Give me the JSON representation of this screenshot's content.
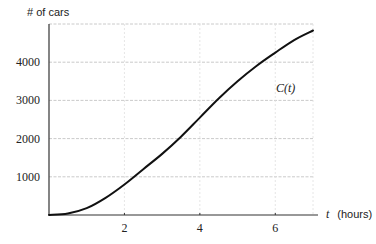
{
  "chart_data": {
    "type": "line",
    "title": "",
    "xlabel": "t (hours)",
    "xlabel_var": "t",
    "xlabel_unit": "(hours)",
    "ylabel": "# of cars",
    "curve_label": "C(t)",
    "xlim": [
      0,
      7
    ],
    "ylim": [
      0,
      5000
    ],
    "x_ticks": [
      2,
      4,
      6
    ],
    "x_tick_labels": [
      "2",
      "4",
      "6"
    ],
    "y_ticks": [
      1000,
      2000,
      3000,
      4000
    ],
    "y_tick_labels": [
      "1000",
      "2000",
      "3000",
      "4000"
    ],
    "grid": true,
    "legend": "none",
    "series": [
      {
        "name": "C(t)",
        "x": [
          0,
          0.5,
          1,
          1.5,
          2,
          2.5,
          3,
          3.5,
          4,
          4.5,
          5,
          5.5,
          6,
          6.5,
          7
        ],
        "values": [
          0,
          40,
          180,
          450,
          800,
          1200,
          1600,
          2050,
          2550,
          3050,
          3500,
          3900,
          4250,
          4580,
          4830
        ]
      }
    ]
  }
}
